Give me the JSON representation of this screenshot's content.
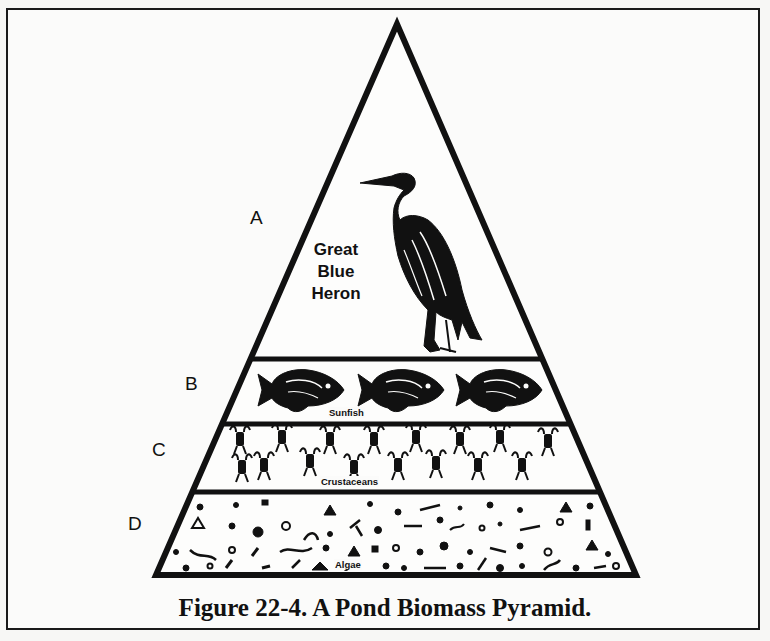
{
  "figure": {
    "caption": "Figure 22-4.  A Pond Biomass Pyramid."
  },
  "pyramid": {
    "levels": [
      {
        "letter": "A",
        "organism": "Great Blue Heron",
        "organism_lines": [
          "Great",
          "Blue",
          "Heron"
        ]
      },
      {
        "letter": "B",
        "organism": "Sunfish"
      },
      {
        "letter": "C",
        "organism": "Crustaceans"
      },
      {
        "letter": "D",
        "organism": "Algae"
      }
    ]
  },
  "colors": {
    "ink": "#111111",
    "paper": "#fbfbfa"
  }
}
